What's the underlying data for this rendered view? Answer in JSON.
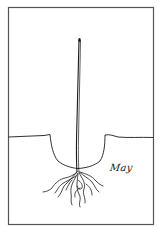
{
  "illustration": {
    "subject": "seedling planted in hole with roots",
    "caption": "May",
    "colors": {
      "background": "#ffffff",
      "ink": "#1a1a1a",
      "border": "#555555"
    }
  }
}
